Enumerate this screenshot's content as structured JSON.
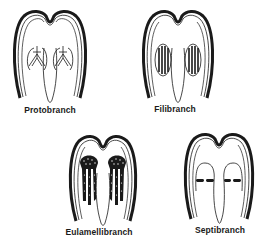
{
  "diagram": {
    "type": "bivalve gill types (cross-section)",
    "colors": {
      "ink": "#1a1a1a",
      "background": "#ffffff"
    },
    "panels": [
      {
        "id": "protobranch",
        "label": "Protobranch",
        "gill_style": "small chevron gill plates"
      },
      {
        "id": "filibranch",
        "label": "Filibranch",
        "gill_style": "filament lamellae"
      },
      {
        "id": "eulamellibranch",
        "label": "Eulamellibranch",
        "gill_style": "fused dotted lamellae"
      },
      {
        "id": "septibranch",
        "label": "Septibranch",
        "gill_style": "horizontal septum"
      }
    ]
  }
}
